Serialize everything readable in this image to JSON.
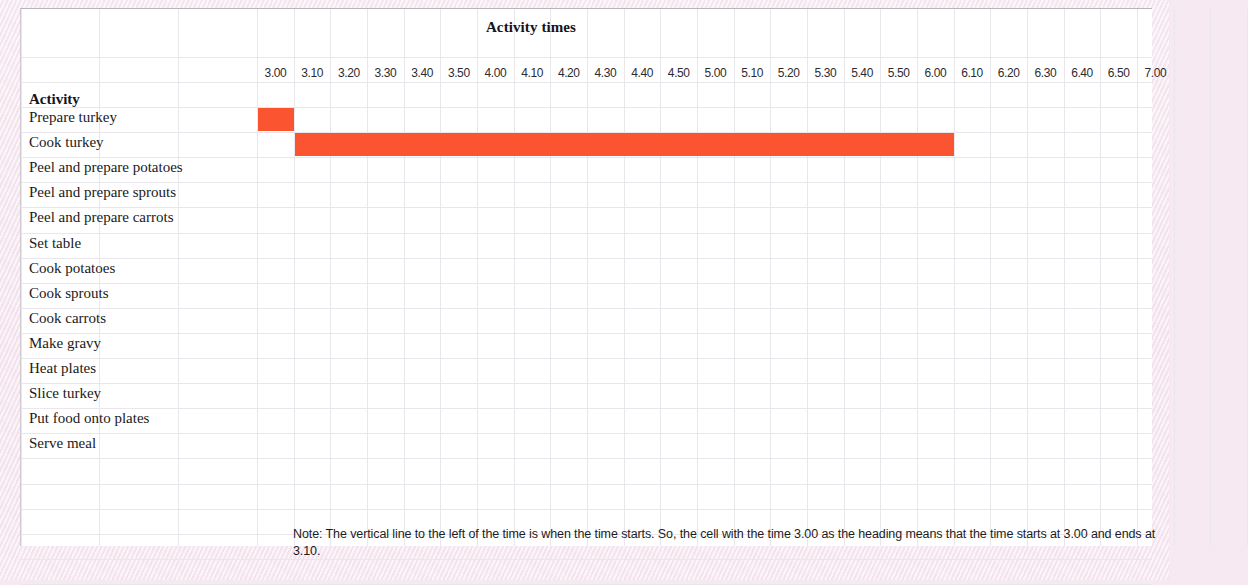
{
  "chart_data": {
    "type": "bar",
    "title": "Activity times",
    "xlabel": "",
    "ylabel": "Activity",
    "orientation": "horizontal",
    "grid": true,
    "legend": "none",
    "x_tick_labels": [
      "3.00",
      "3.10",
      "3.20",
      "3.30",
      "3.40",
      "3.50",
      "4.00",
      "4.10",
      "4.20",
      "4.30",
      "4.40",
      "4.50",
      "5.00",
      "5.10",
      "5.20",
      "5.30",
      "5.40",
      "5.50",
      "6.00",
      "6.10",
      "6.20",
      "6.30",
      "6.40",
      "6.50",
      "7.00"
    ],
    "xlim": [
      "3.00",
      "7.00"
    ],
    "tick_interval_minutes": 10,
    "categories": [
      "Prepare turkey",
      "Cook turkey",
      "Peel and prepare potatoes",
      "Peel and prepare sprouts",
      "Peel and prepare carrots",
      "Set table",
      "Cook potatoes",
      "Cook sprouts",
      "Cook carrots",
      "Make gravy",
      "Heat plates",
      "Slice turkey",
      "Put food onto plates",
      "Serve meal"
    ],
    "bars": [
      {
        "activity": "Prepare turkey",
        "start": "3.00",
        "end": "3.10",
        "start_index": 0,
        "span": 1,
        "color": "#fa5430"
      },
      {
        "activity": "Cook turkey",
        "start": "3.10",
        "end": "6.10",
        "start_index": 1,
        "span": 18,
        "color": "#fa5430"
      }
    ]
  },
  "header": {
    "title": "Activity times",
    "activity_column_label": "Activity"
  },
  "note": {
    "text": "Note:  The vertical line to the left of the time is when the time starts.  So, the cell with the time 3.00 as the heading means that the time starts at 3.00 and ends at 3.10."
  },
  "colors": {
    "bar": "#fa5430",
    "sheet": "#ffffff",
    "gridline": "#e9e7ec",
    "backdrop": "#f6e9f1",
    "text": "#1b1920"
  }
}
